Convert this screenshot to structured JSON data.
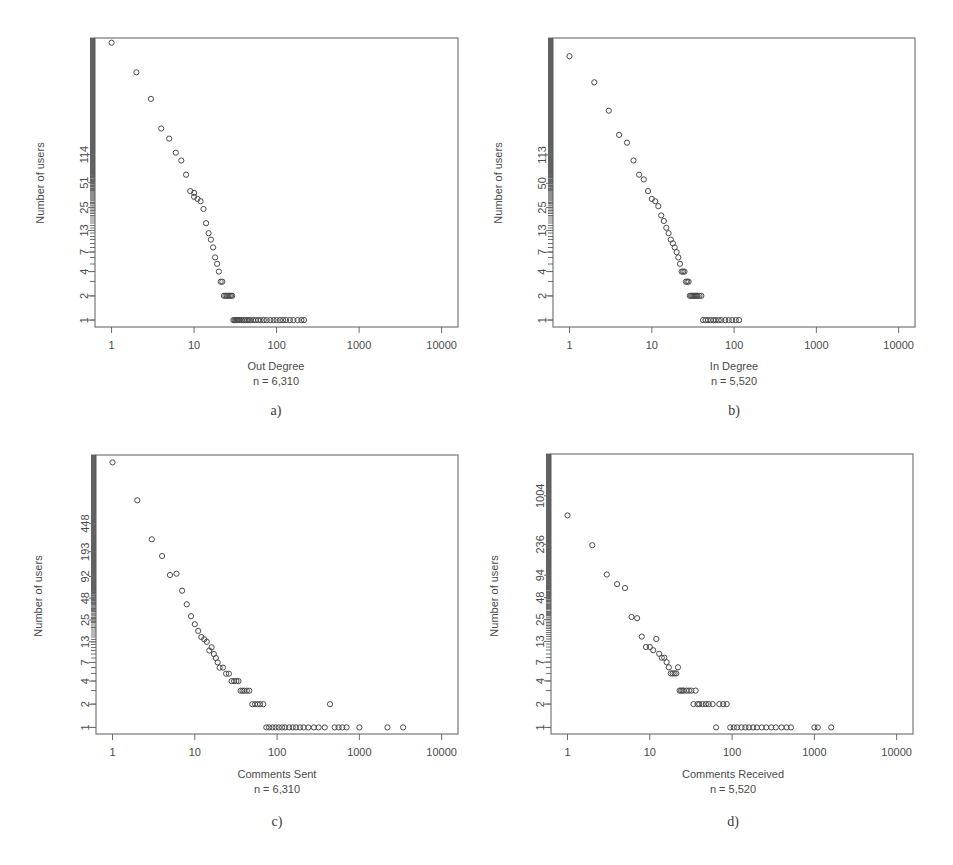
{
  "figure": {
    "title": "",
    "background": "#ffffff",
    "point_color": "#4a4a4a",
    "axis_color": "#6b6b6b"
  },
  "panels": [
    {
      "id": "a",
      "letter": "a)",
      "xlabel": "Out Degree",
      "sublabel": "n = 6,310",
      "ylabel": "Number of users"
    },
    {
      "id": "b",
      "letter": "b)",
      "xlabel": "In Degree",
      "sublabel": "n = 5,520",
      "ylabel": "Number of users"
    },
    {
      "id": "c",
      "letter": "c)",
      "xlabel": "Comments Sent",
      "sublabel": "n = 6,310",
      "ylabel": "Number of users"
    },
    {
      "id": "d",
      "letter": "d)",
      "xlabel": "Comments Received",
      "sublabel": "n = 5,520",
      "ylabel": "Number of users"
    }
  ],
  "chart_data": [
    {
      "type": "scatter",
      "panel": "a",
      "title": "Out Degree",
      "subtitle": "n = 6,310",
      "xlabel": "Out Degree",
      "ylabel": "Number of users",
      "xscale": "log",
      "yscale": "log",
      "xlim": [
        0.63,
        15800
      ],
      "ylim": [
        0.82,
        3200
      ],
      "xticks": [
        1,
        10,
        100,
        1000,
        10000
      ],
      "xticklabels": [
        "1",
        "10",
        "100",
        "1000",
        "10000"
      ],
      "yticks": [
        1,
        2,
        4,
        7,
        13,
        25,
        51,
        114
      ],
      "yticklabels": [
        "1",
        "2",
        "4",
        "7",
        "13",
        "25",
        "51",
        "114"
      ],
      "grid": false,
      "legend": "none",
      "x": [
        1,
        2,
        3,
        4,
        5,
        6,
        7,
        8,
        9,
        10,
        10,
        11,
        12,
        13,
        14,
        15,
        16,
        17,
        18,
        19,
        20,
        21,
        22,
        23,
        24,
        25,
        26,
        27,
        28,
        29,
        30,
        31,
        32,
        33,
        34,
        35,
        36,
        38,
        40,
        42,
        44,
        46,
        48,
        52,
        56,
        60,
        64,
        70,
        76,
        84,
        92,
        100,
        110,
        120,
        130,
        145,
        160,
        180,
        200,
        215
      ],
      "y": [
        2800,
        1200,
        560,
        240,
        180,
        120,
        96,
        64,
        40,
        38,
        34,
        32,
        30,
        24,
        16,
        12,
        10,
        8,
        6,
        5,
        4,
        3,
        3,
        2,
        2,
        2,
        2,
        2,
        2,
        2,
        1,
        1,
        1,
        1,
        1,
        1,
        1,
        1,
        1,
        1,
        1,
        1,
        1,
        1,
        1,
        1,
        1,
        1,
        1,
        1,
        1,
        1,
        1,
        1,
        1,
        1,
        1,
        1,
        1,
        1
      ]
    },
    {
      "type": "scatter",
      "panel": "b",
      "title": "In Degree",
      "subtitle": "n = 5,520",
      "xlabel": "In Degree",
      "ylabel": "Number of users",
      "xscale": "log",
      "yscale": "log",
      "xlim": [
        0.63,
        15800
      ],
      "ylim": [
        0.82,
        3200
      ],
      "xticks": [
        1,
        10,
        100,
        1000,
        10000
      ],
      "xticklabels": [
        "1",
        "10",
        "100",
        "1000",
        "10000"
      ],
      "yticks": [
        1,
        2,
        4,
        7,
        13,
        25,
        50,
        113
      ],
      "yticklabels": [
        "1",
        "2",
        "4",
        "7",
        "13",
        "25",
        "50",
        "113"
      ],
      "grid": false,
      "legend": "none",
      "x": [
        1,
        2,
        3,
        4,
        5,
        6,
        7,
        8,
        9,
        10,
        11,
        12,
        13,
        14,
        15,
        16,
        17,
        18,
        19,
        20,
        21,
        22,
        23,
        24,
        25,
        26,
        27,
        28,
        29,
        30,
        31,
        32,
        33,
        34,
        35,
        36,
        38,
        40,
        42,
        45,
        48,
        52,
        56,
        60,
        65,
        70,
        78,
        86,
        95,
        105,
        115
      ],
      "y": [
        1900,
        900,
        400,
        200,
        160,
        96,
        64,
        56,
        40,
        32,
        30,
        26,
        20,
        17,
        14,
        12,
        10,
        9,
        8,
        7,
        6,
        5,
        4,
        4,
        4,
        3,
        3,
        3,
        2,
        2,
        2,
        2,
        2,
        2,
        2,
        2,
        2,
        2,
        1,
        1,
        1,
        1,
        1,
        1,
        1,
        1,
        1,
        1,
        1,
        1,
        1
      ]
    },
    {
      "type": "scatter",
      "panel": "c",
      "title": "Comments Sent",
      "subtitle": "n = 6,310",
      "xlabel": "Comments Sent",
      "ylabel": "Number of users",
      "xscale": "log",
      "yscale": "log",
      "xlim": [
        0.63,
        15800
      ],
      "ylim": [
        0.82,
        3500
      ],
      "xticks": [
        1,
        10,
        100,
        1000,
        10000
      ],
      "xticklabels": [
        "1",
        "10",
        "100",
        "1000",
        "10000"
      ],
      "yticks": [
        1,
        2,
        4,
        7,
        13,
        25,
        48,
        92,
        193,
        448
      ],
      "yticklabels": [
        "1",
        "2",
        "4",
        "7",
        "13",
        "25",
        "48",
        "92",
        "193",
        "448"
      ],
      "grid": false,
      "legend": "none",
      "x": [
        1,
        2,
        3,
        4,
        5,
        6,
        7,
        8,
        9,
        10,
        11,
        12,
        13,
        14,
        15,
        16,
        17,
        18,
        19,
        20,
        22,
        24,
        26,
        28,
        30,
        32,
        34,
        36,
        38,
        40,
        43,
        46,
        50,
        54,
        58,
        62,
        68,
        74,
        80,
        88,
        96,
        105,
        115,
        125,
        140,
        155,
        170,
        190,
        210,
        240,
        280,
        320,
        380,
        440,
        500,
        560,
        620,
        700,
        1000,
        2200,
        3400
      ],
      "y": [
        2800,
        900,
        280,
        170,
        96,
        100,
        60,
        40,
        28,
        22,
        18,
        15,
        14,
        13,
        10,
        11,
        9,
        8,
        7,
        6,
        6,
        5,
        5,
        4,
        4,
        4,
        4,
        3,
        3,
        3,
        3,
        3,
        2,
        2,
        2,
        2,
        2,
        1,
        1,
        1,
        1,
        1,
        1,
        1,
        1,
        1,
        1,
        1,
        1,
        1,
        1,
        1,
        1,
        2,
        1,
        1,
        1,
        1,
        1,
        1,
        1
      ]
    },
    {
      "type": "scatter",
      "panel": "d",
      "title": "Comments Received",
      "subtitle": "n = 5,520",
      "xlabel": "Comments Received",
      "ylabel": "Number of users",
      "xscale": "log",
      "yscale": "log",
      "xlim": [
        0.63,
        15800
      ],
      "ylim": [
        0.82,
        3500
      ],
      "xticks": [
        1,
        10,
        100,
        1000,
        10000
      ],
      "xticklabels": [
        "1",
        "10",
        "100",
        "1000",
        "10000"
      ],
      "yticks": [
        1,
        2,
        4,
        7,
        13,
        25,
        48,
        94,
        236,
        1004
      ],
      "yticklabels": [
        "1",
        "2",
        "4",
        "7",
        "13",
        "25",
        "48",
        "94",
        "236",
        "1004"
      ],
      "grid": false,
      "legend": "none",
      "x": [
        1,
        2,
        3,
        4,
        5,
        6,
        7,
        8,
        9,
        10,
        11,
        12,
        13,
        14,
        15,
        16,
        17,
        18,
        19,
        20,
        21,
        22,
        23,
        24,
        25,
        26,
        28,
        30,
        32,
        34,
        36,
        38,
        40,
        44,
        48,
        52,
        58,
        64,
        70,
        78,
        86,
        95,
        105,
        115,
        130,
        145,
        160,
        180,
        200,
        230,
        260,
        300,
        340,
        400,
        460,
        520,
        1000,
        1100,
        1600
      ],
      "y": [
        560,
        230,
        96,
        72,
        64,
        27,
        26,
        15,
        11,
        11,
        10,
        14,
        9,
        8,
        8,
        7,
        6,
        5,
        5,
        5,
        5,
        6,
        3,
        3,
        3,
        3,
        3,
        3,
        3,
        2,
        3,
        2,
        2,
        2,
        2,
        2,
        2,
        1,
        2,
        2,
        2,
        1,
        1,
        1,
        1,
        1,
        1,
        1,
        1,
        1,
        1,
        1,
        1,
        1,
        1,
        1,
        1,
        1,
        1
      ]
    }
  ]
}
